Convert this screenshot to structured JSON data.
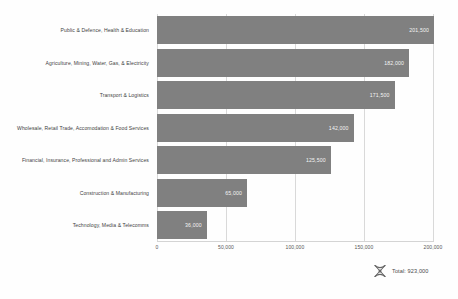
{
  "chart_data": {
    "type": "bar",
    "orientation": "horizontal",
    "title": "",
    "xlabel": "",
    "ylabel": "",
    "grid": true,
    "xlim": [
      0,
      200000
    ],
    "categories": [
      "Public & Defence, Health & Education",
      "Agriculture, Mining, Water, Gas, & Electricity",
      "Transport & Logistics",
      "Wholesale, Retail Trade, Accomodation & Food Services",
      "Financial, Insurance, Professional and Admin Services",
      "Construction & Manufacturing",
      "Technology, Media & Telecomms"
    ],
    "values": [
      201500,
      182000,
      171500,
      142000,
      125500,
      65000,
      36000
    ],
    "value_labels": [
      "201,500",
      "182,000",
      "171,500",
      "142,000",
      "125,500",
      "65,000",
      "36,000"
    ],
    "xticks": [
      0,
      50000,
      100000,
      150000,
      200000
    ],
    "xtick_labels": [
      "0",
      "50,000",
      "100,000",
      "150,000",
      "200,000"
    ],
    "bar_color": "#808080",
    "grid_color": "#d9d9d9",
    "label_color": "#3f3f3f"
  },
  "footer": {
    "total_label": "Total: 923,000",
    "total_icon": "x-marker-icon"
  }
}
